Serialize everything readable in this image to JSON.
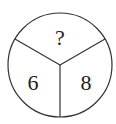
{
  "diagram": {
    "type": "circle-divided-into-three-sectors",
    "sectors": [
      {
        "position": "top",
        "value": "?"
      },
      {
        "position": "bottom-left",
        "value": "6"
      },
      {
        "position": "bottom-right",
        "value": "8"
      }
    ],
    "stroke_color": "#333333",
    "background_color": "#ffffff"
  }
}
